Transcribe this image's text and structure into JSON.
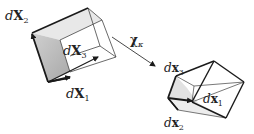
{
  "diagram": {
    "type": "deformation-map",
    "reference_config": {
      "labels": {
        "e1": {
          "d": "d",
          "sym": "X",
          "sub": "1"
        },
        "e2": {
          "d": "d",
          "sym": "X",
          "sub": "2"
        },
        "e3": {
          "d": "d",
          "sym": "X",
          "sub": "3"
        }
      }
    },
    "map": {
      "sym": "χ",
      "sub": "κ"
    },
    "current_config": {
      "labels": {
        "e1": {
          "d": "d",
          "sym": "x",
          "sub": "1"
        },
        "e2": {
          "d": "d",
          "sym": "x",
          "sub": "2"
        },
        "e3": {
          "d": "d",
          "sym": "x",
          "sub": "3"
        }
      }
    },
    "colors": {
      "stroke": "#1a1a1a",
      "thin_stroke": "#444444",
      "front_face_fill": "#bdbdbd",
      "top_face_fill": "#e6e6e6",
      "deformed_face_fill": "#e4e4e4"
    }
  }
}
